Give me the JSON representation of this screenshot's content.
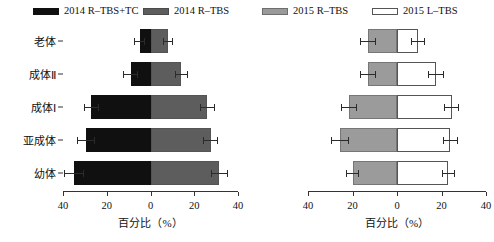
{
  "legend": {
    "items": [
      {
        "label": "2014 R–TBS+TC",
        "swatch": "black-swatch",
        "color": "#101010"
      },
      {
        "label": "2014 R–TBS",
        "swatch": "dark-gray-swatch",
        "color": "#5d5d5d"
      },
      {
        "label": "2015 R–TBS",
        "swatch": "mid-gray-swatch",
        "color": "#9b9b9b"
      },
      {
        "label": "2015 L–TBS",
        "swatch": "white-swatch",
        "color": "#ffffff"
      }
    ]
  },
  "categories": [
    "老体",
    "成体Ⅱ",
    "成体Ⅰ",
    "亚成体",
    "幼体"
  ],
  "axis": {
    "title": "百分比（%）",
    "tick_labels": [
      "40",
      "20",
      "0",
      "20",
      "40"
    ],
    "tick_values": [
      -40,
      -20,
      0,
      20,
      40
    ],
    "range": [
      -40,
      40
    ]
  },
  "chart_data": [
    {
      "type": "bar",
      "id": "left-pyramid",
      "title": "",
      "subtitle": "",
      "orientation": "horizontal-diverging",
      "xlabel": "百分比（%）",
      "ylabel": "",
      "xlim": [
        -40,
        40
      ],
      "xticks": [
        -40,
        -20,
        0,
        20,
        40
      ],
      "xticklabels": [
        "40",
        "20",
        "0",
        "20",
        "40"
      ],
      "grid": false,
      "legend_position": "top",
      "categories": [
        "老体",
        "成体Ⅱ",
        "成体Ⅰ",
        "亚成体",
        "幼体"
      ],
      "series": [
        {
          "name": "2014 R–TBS+TC",
          "side": "left",
          "color": "#101010",
          "values": [
            5.0,
            9.0,
            27.0,
            29.5,
            35.0
          ],
          "errors": [
            2.5,
            3.5,
            3.5,
            4.0,
            4.5
          ]
        },
        {
          "name": "2014 R–TBS",
          "side": "right",
          "color": "#5d5d5d",
          "values": [
            8.0,
            14.0,
            26.0,
            27.5,
            31.5
          ],
          "errors": [
            2.5,
            3.0,
            3.5,
            3.5,
            4.0
          ]
        }
      ]
    },
    {
      "type": "bar",
      "id": "right-pyramid",
      "title": "",
      "subtitle": "",
      "orientation": "horizontal-diverging",
      "xlabel": "百分比（%）",
      "ylabel": "",
      "xlim": [
        -40,
        40
      ],
      "xticks": [
        -40,
        -20,
        0,
        20,
        40
      ],
      "xticklabels": [
        "40",
        "20",
        "0",
        "20",
        "40"
      ],
      "grid": false,
      "legend_position": "top",
      "categories": [
        "老体",
        "成体Ⅱ",
        "成体Ⅰ",
        "亚成体",
        "幼体"
      ],
      "series": [
        {
          "name": "2015 R–TBS",
          "side": "left",
          "color": "#9b9b9b",
          "values": [
            13.0,
            13.0,
            21.5,
            25.5,
            20.0
          ],
          "errors": [
            3.5,
            3.5,
            3.5,
            4.0,
            3.0
          ]
        },
        {
          "name": "2015 L–TBS",
          "side": "right",
          "color": "#ffffff",
          "values": [
            9.5,
            17.5,
            24.5,
            24.0,
            23.0
          ],
          "errors": [
            3.0,
            3.5,
            3.5,
            3.5,
            3.0
          ]
        }
      ]
    }
  ]
}
